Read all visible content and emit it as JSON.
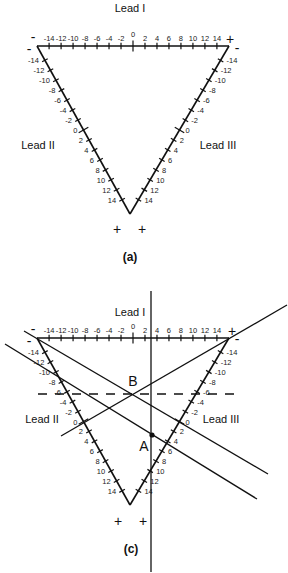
{
  "figure_a": {
    "caption": "(a)",
    "leads": {
      "lead_I": "Lead I",
      "lead_II": "Lead II",
      "lead_III": "Lead III"
    },
    "lead_I_ticks": [
      "-14",
      "-12",
      "-10",
      "-8",
      "-6",
      "-4",
      "-2",
      "0",
      "2",
      "4",
      "6",
      "8",
      "10",
      "12",
      "14"
    ],
    "lead_II_ticks": [
      "-14",
      "-12",
      "-10",
      "-8",
      "-6",
      "-4",
      "-2",
      "0",
      "2",
      "4",
      "6",
      "8",
      "10",
      "12",
      "14"
    ],
    "lead_III_ticks": [
      "14",
      "12",
      "10",
      "8",
      "6",
      "4",
      "2",
      "0",
      "-2",
      "-4",
      "-6",
      "-8",
      "-10",
      "-12",
      "-14"
    ],
    "polarity": {
      "lead_I_left": "-",
      "lead_I_right": "+",
      "lead_II_top": "-",
      "lead_III_top": "-",
      "lead_II_bottom": "+",
      "lead_III_bottom": "+"
    }
  },
  "figure_c": {
    "caption": "(c)",
    "leads": {
      "lead_I": "Lead I",
      "lead_II": "Lead II",
      "lead_III": "Lead III"
    },
    "lead_I_ticks": [
      "-14",
      "-12",
      "-10",
      "-8",
      "-6",
      "-4",
      "-2",
      "0",
      "2",
      "4",
      "6",
      "8",
      "10",
      "12",
      "14"
    ],
    "lead_II_ticks": [
      "-14",
      "-12",
      "-10",
      "-8",
      "-6",
      "-4",
      "-2",
      "0",
      "2",
      "4",
      "6",
      "8",
      "10",
      "12",
      "14"
    ],
    "lead_III_ticks": [
      "14",
      "12",
      "10",
      "8",
      "6",
      "4",
      "2",
      "0",
      "-2",
      "-4",
      "-6",
      "-8",
      "-10",
      "-12",
      "-14"
    ],
    "polarity": {
      "lead_I_left": "-",
      "lead_I_right": "+",
      "lead_II_top": "-",
      "lead_III_top": "-",
      "lead_II_bottom": "+",
      "lead_III_bottom": "+"
    },
    "points": {
      "A": "A",
      "B": "B"
    }
  }
}
